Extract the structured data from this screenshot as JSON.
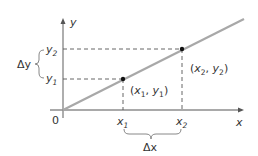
{
  "diagram": {
    "axes": {
      "x_label": "x",
      "y_label": "y",
      "origin_label": "0"
    },
    "points": [
      {
        "name": "P1",
        "label": "(x1, y1)",
        "x_label": "x1",
        "y_label": "y1"
      },
      {
        "name": "P2",
        "label": "(x2, y2)",
        "x_label": "x2",
        "y_label": "y2"
      }
    ],
    "delta_x_label": "Δx",
    "delta_y_label": "Δy",
    "colors": {
      "line": "#a8a8a8",
      "axes": "#8c8c8c",
      "dashes": "#555555",
      "points": "#111111",
      "text": "#333333"
    }
  }
}
